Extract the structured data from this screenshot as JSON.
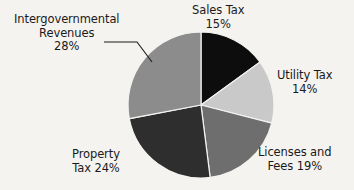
{
  "chart_data": {
    "type": "pie",
    "title": "",
    "categories": [
      "Sales Tax",
      "Utility Tax",
      "Licenses and Fees",
      "Property Tax",
      "Intergovernmental Revenues"
    ],
    "values": [
      15,
      14,
      19,
      24,
      28
    ],
    "unit": "%",
    "start_angle_deg": 0,
    "direction": "clockwise",
    "legend": "none",
    "grid": false,
    "slices": [
      {
        "name": "Sales Tax",
        "value": 15,
        "value_label": "15%",
        "color": "#0d0d0d",
        "label_line1": "Sales Tax",
        "label_line2": "15%"
      },
      {
        "name": "Utility Tax",
        "value": 14,
        "value_label": "14%",
        "color": "#c9c9c9",
        "label_line1": "Utility Tax",
        "label_line2": "14%"
      },
      {
        "name": "Licenses and Fees",
        "value": 19,
        "value_label": "19%",
        "color": "#6e6e6e",
        "label_line1": "Licenses and",
        "label_line2": "Fees 19%"
      },
      {
        "name": "Property Tax",
        "value": 24,
        "value_label": "24%",
        "color": "#2e2e2e",
        "label_line1": "Property",
        "label_line2": "Tax 24%"
      },
      {
        "name": "Intergovernmental Revenues",
        "value": 28,
        "value_label": "28%",
        "color": "#8c8c8c",
        "label_line1": "Intergovernmental",
        "label_line2": "Revenues",
        "label_line3": "28%"
      }
    ],
    "colors": {
      "background": "#f5f3f0",
      "text": "#1a1a1a",
      "slice_border": "#f5f3f0",
      "leader_line": "#1a1a1a"
    }
  },
  "labels": {
    "sales": {
      "line1": "Sales Tax",
      "line2": "15%"
    },
    "utility": {
      "line1": "Utility Tax",
      "line2": "14%"
    },
    "licenses": {
      "line1": "Licenses and",
      "line2": "Fees 19%"
    },
    "property": {
      "line1": "Property",
      "line2": "Tax 24%"
    },
    "intergov": {
      "line1": "Intergovernmental",
      "line2": "Revenues",
      "line3": "28%"
    }
  }
}
